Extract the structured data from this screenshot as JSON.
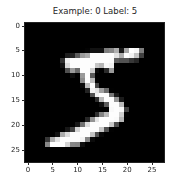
{
  "chart_data": {
    "type": "heatmap",
    "title": "Example: 0  Label: 5",
    "colormap": "gray",
    "xlabel": "",
    "ylabel": "",
    "xlim": [
      -0.5,
      27.5
    ],
    "ylim": [
      27.5,
      -0.5
    ],
    "xticks": [
      0,
      5,
      10,
      15,
      20,
      25
    ],
    "yticks": [
      0,
      5,
      10,
      15,
      20,
      25
    ],
    "grid": false,
    "shape": [
      28,
      28
    ],
    "values": [
      [
        0,
        0,
        0,
        0,
        0,
        0,
        0,
        0,
        0,
        0,
        0,
        0,
        0,
        0,
        0,
        0,
        0,
        0,
        0,
        0,
        0,
        0,
        0,
        0,
        0,
        0,
        0,
        0
      ],
      [
        0,
        0,
        0,
        0,
        0,
        0,
        0,
        0,
        0,
        0,
        0,
        0,
        0,
        0,
        0,
        0,
        0,
        0,
        0,
        0,
        0,
        0,
        0,
        0,
        0,
        0,
        0,
        0
      ],
      [
        0,
        0,
        0,
        0,
        0,
        0,
        0,
        0,
        0,
        0,
        0,
        0,
        0,
        0,
        0,
        0,
        0,
        0,
        0,
        0,
        0,
        0,
        0,
        0,
        0,
        0,
        0,
        0
      ],
      [
        0,
        0,
        0,
        0,
        0,
        0,
        0,
        0,
        0,
        0,
        0,
        0,
        0,
        0,
        0,
        0,
        0,
        0,
        0,
        0,
        0,
        0,
        0,
        0,
        0,
        0,
        0,
        0
      ],
      [
        0,
        0,
        0,
        0,
        0,
        0,
        0,
        0,
        0,
        0,
        0,
        0,
        0,
        0,
        0,
        0,
        0,
        0,
        0,
        0,
        0,
        0,
        0,
        0,
        0,
        0,
        0,
        0
      ],
      [
        0,
        0,
        0,
        0,
        0,
        0,
        0,
        0,
        0,
        0,
        0,
        0,
        3,
        18,
        18,
        18,
        126,
        136,
        175,
        26,
        166,
        255,
        247,
        127,
        0,
        0,
        0,
        0
      ],
      [
        0,
        0,
        0,
        0,
        0,
        0,
        0,
        0,
        30,
        36,
        94,
        154,
        170,
        253,
        253,
        253,
        253,
        253,
        225,
        172,
        253,
        242,
        195,
        64,
        0,
        0,
        0,
        0
      ],
      [
        0,
        0,
        0,
        0,
        0,
        0,
        0,
        49,
        238,
        253,
        253,
        253,
        253,
        253,
        253,
        253,
        253,
        251,
        93,
        82,
        82,
        56,
        39,
        0,
        0,
        0,
        0,
        0
      ],
      [
        0,
        0,
        0,
        0,
        0,
        0,
        0,
        18,
        219,
        253,
        253,
        253,
        253,
        253,
        198,
        182,
        247,
        241,
        0,
        0,
        0,
        0,
        0,
        0,
        0,
        0,
        0,
        0
      ],
      [
        0,
        0,
        0,
        0,
        0,
        0,
        0,
        0,
        80,
        156,
        107,
        253,
        253,
        205,
        11,
        0,
        43,
        154,
        0,
        0,
        0,
        0,
        0,
        0,
        0,
        0,
        0,
        0
      ],
      [
        0,
        0,
        0,
        0,
        0,
        0,
        0,
        0,
        0,
        14,
        1,
        154,
        253,
        90,
        0,
        0,
        0,
        0,
        0,
        0,
        0,
        0,
        0,
        0,
        0,
        0,
        0,
        0
      ],
      [
        0,
        0,
        0,
        0,
        0,
        0,
        0,
        0,
        0,
        0,
        0,
        139,
        253,
        190,
        2,
        0,
        0,
        0,
        0,
        0,
        0,
        0,
        0,
        0,
        0,
        0,
        0,
        0
      ],
      [
        0,
        0,
        0,
        0,
        0,
        0,
        0,
        0,
        0,
        0,
        0,
        11,
        190,
        253,
        70,
        0,
        0,
        0,
        0,
        0,
        0,
        0,
        0,
        0,
        0,
        0,
        0,
        0
      ],
      [
        0,
        0,
        0,
        0,
        0,
        0,
        0,
        0,
        0,
        0,
        0,
        0,
        35,
        241,
        225,
        160,
        108,
        1,
        0,
        0,
        0,
        0,
        0,
        0,
        0,
        0,
        0,
        0
      ],
      [
        0,
        0,
        0,
        0,
        0,
        0,
        0,
        0,
        0,
        0,
        0,
        0,
        0,
        81,
        240,
        253,
        253,
        119,
        25,
        0,
        0,
        0,
        0,
        0,
        0,
        0,
        0,
        0
      ],
      [
        0,
        0,
        0,
        0,
        0,
        0,
        0,
        0,
        0,
        0,
        0,
        0,
        0,
        0,
        45,
        186,
        253,
        253,
        150,
        27,
        0,
        0,
        0,
        0,
        0,
        0,
        0,
        0
      ],
      [
        0,
        0,
        0,
        0,
        0,
        0,
        0,
        0,
        0,
        0,
        0,
        0,
        0,
        0,
        0,
        16,
        93,
        252,
        253,
        187,
        0,
        0,
        0,
        0,
        0,
        0,
        0,
        0
      ],
      [
        0,
        0,
        0,
        0,
        0,
        0,
        0,
        0,
        0,
        0,
        0,
        0,
        0,
        0,
        0,
        0,
        0,
        249,
        253,
        249,
        64,
        0,
        0,
        0,
        0,
        0,
        0,
        0
      ],
      [
        0,
        0,
        0,
        0,
        0,
        0,
        0,
        0,
        0,
        0,
        0,
        0,
        0,
        0,
        46,
        130,
        183,
        253,
        253,
        207,
        2,
        0,
        0,
        0,
        0,
        0,
        0,
        0
      ],
      [
        0,
        0,
        0,
        0,
        0,
        0,
        0,
        0,
        0,
        0,
        0,
        0,
        39,
        148,
        229,
        253,
        253,
        253,
        250,
        182,
        0,
        0,
        0,
        0,
        0,
        0,
        0,
        0
      ],
      [
        0,
        0,
        0,
        0,
        0,
        0,
        0,
        0,
        0,
        0,
        24,
        114,
        221,
        253,
        253,
        253,
        253,
        201,
        78,
        0,
        0,
        0,
        0,
        0,
        0,
        0,
        0,
        0
      ],
      [
        0,
        0,
        0,
        0,
        0,
        0,
        0,
        0,
        23,
        66,
        213,
        253,
        253,
        253,
        253,
        198,
        81,
        2,
        0,
        0,
        0,
        0,
        0,
        0,
        0,
        0,
        0,
        0
      ],
      [
        0,
        0,
        0,
        0,
        0,
        0,
        18,
        171,
        219,
        253,
        253,
        253,
        253,
        195,
        80,
        9,
        0,
        0,
        0,
        0,
        0,
        0,
        0,
        0,
        0,
        0,
        0,
        0
      ],
      [
        0,
        0,
        0,
        0,
        55,
        172,
        226,
        253,
        253,
        253,
        253,
        244,
        133,
        11,
        0,
        0,
        0,
        0,
        0,
        0,
        0,
        0,
        0,
        0,
        0,
        0,
        0,
        0
      ],
      [
        0,
        0,
        0,
        0,
        136,
        253,
        253,
        253,
        212,
        135,
        132,
        16,
        0,
        0,
        0,
        0,
        0,
        0,
        0,
        0,
        0,
        0,
        0,
        0,
        0,
        0,
        0,
        0
      ],
      [
        0,
        0,
        0,
        0,
        0,
        0,
        0,
        0,
        0,
        0,
        0,
        0,
        0,
        0,
        0,
        0,
        0,
        0,
        0,
        0,
        0,
        0,
        0,
        0,
        0,
        0,
        0,
        0
      ],
      [
        0,
        0,
        0,
        0,
        0,
        0,
        0,
        0,
        0,
        0,
        0,
        0,
        0,
        0,
        0,
        0,
        0,
        0,
        0,
        0,
        0,
        0,
        0,
        0,
        0,
        0,
        0,
        0
      ],
      [
        0,
        0,
        0,
        0,
        0,
        0,
        0,
        0,
        0,
        0,
        0,
        0,
        0,
        0,
        0,
        0,
        0,
        0,
        0,
        0,
        0,
        0,
        0,
        0,
        0,
        0,
        0,
        0
      ]
    ]
  },
  "tick_labels": {
    "x": [
      "0",
      "5",
      "10",
      "15",
      "20",
      "25"
    ],
    "y": [
      "0",
      "5",
      "10",
      "15",
      "20",
      "25"
    ]
  }
}
